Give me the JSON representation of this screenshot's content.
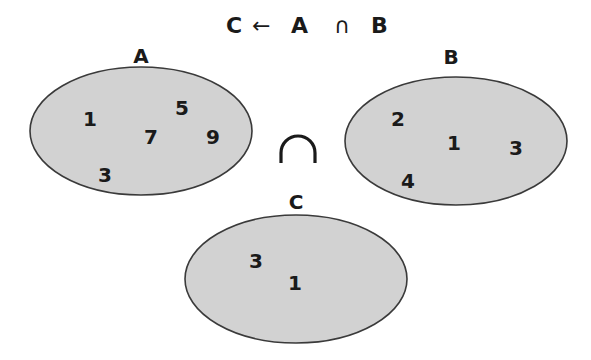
{
  "title": {
    "result": "C",
    "arrow": "←",
    "left_operand": "A",
    "operator": "∩",
    "right_operand": "B"
  },
  "sets": {
    "A": {
      "label": "A",
      "elements": [
        "1",
        "5",
        "7",
        "9",
        "3"
      ]
    },
    "B": {
      "label": "B",
      "elements": [
        "2",
        "1",
        "3",
        "4"
      ]
    },
    "C": {
      "label": "C",
      "elements": [
        "3",
        "1"
      ]
    }
  },
  "operator_symbol": "∩",
  "colors": {
    "set_fill": "#d2d2d2",
    "set_stroke": "#3a3a3a",
    "text": "#1a1a1a"
  }
}
